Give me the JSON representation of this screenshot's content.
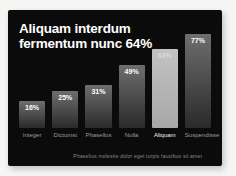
{
  "slide": {
    "title_line1": "Aliquam interdum",
    "title_line2": "fermentum nunc 64%",
    "footnote": "Phasellus molestie dolor eget turpis faucibus sit amet",
    "colors": {
      "page_bg": "#f5f5f4",
      "slide_bg": "#0b0b0b",
      "title": "#ffffff",
      "bar_top": "#6e6e6e",
      "bar_bottom": "#2a2a2a",
      "bar_highlight_top": "#c3c3c3",
      "bar_highlight_bottom": "#a7a7a7",
      "value_label": "#ffffff",
      "value_label_highlight": "#d9d9d9",
      "category_label": "#9b9b9b",
      "category_label_highlight": "#f0f0f0",
      "footnote": "#8c8c8c"
    }
  },
  "chart_data": {
    "type": "bar",
    "title": "Aliquam interdum fermentum nunc 64%",
    "categories": [
      "Integer",
      "Dictumst",
      "Phasellus",
      "Nulla",
      "Aliquam",
      "Suspendisse"
    ],
    "values": [
      16,
      25,
      31,
      49,
      64,
      77
    ],
    "value_labels": [
      "16%",
      "25%",
      "31%",
      "49%",
      "64%",
      "77%"
    ],
    "highlighted_category": "Aliquam",
    "highlighted_index": 4,
    "xlabel": "",
    "ylabel": "",
    "ylim": [
      0,
      100
    ],
    "grid": false,
    "legend": false,
    "value_label_position": "inside-top",
    "bar_style": "vertical gray gradient, highlighted bar light gray"
  }
}
